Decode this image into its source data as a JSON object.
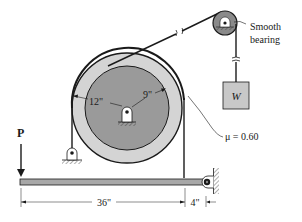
{
  "diagram": {
    "type": "band-brake mechanics problem",
    "labels": {
      "force": "P",
      "weight": "W",
      "outer_radius": "12\"",
      "inner_radius": "9\"",
      "friction": "μ = 0.60",
      "bearing_line1": "Smooth",
      "bearing_line2": "bearing",
      "lever_long": "36\"",
      "lever_short": "4\""
    },
    "colors": {
      "outer_drum": "#d4d4d4",
      "inner_drum": "#9a9a9a",
      "pulley": "#8a8a8a",
      "lever": "#a8a8a8",
      "weight_box": "#c8c8c8",
      "line": "#1a1a1a"
    }
  }
}
